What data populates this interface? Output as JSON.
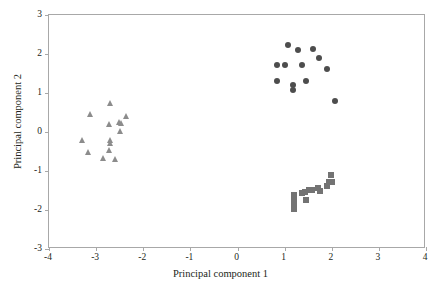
{
  "chart_data": {
    "type": "scatter",
    "title": "",
    "xlabel": "Principal component 1",
    "ylabel": "Principal component 2",
    "xlim": [
      -4,
      4
    ],
    "ylim": [
      -3,
      3
    ],
    "xticks": [
      "-4",
      "-3",
      "-2",
      "-1",
      "0",
      "1",
      "2",
      "3",
      "4"
    ],
    "xtick_values": [
      -4,
      -3,
      -2,
      -1,
      0,
      1,
      2,
      3,
      4
    ],
    "yticks": [
      "3",
      "2",
      "1",
      "0",
      "-1",
      "-2",
      "-3"
    ],
    "ytick_values": [
      3,
      2,
      1,
      0,
      -1,
      -2,
      -3
    ],
    "grid": false,
    "legend": "none",
    "series": [
      {
        "name": "group-circles",
        "marker": "circle",
        "color": "#4d4d4d",
        "points": [
          [
            1.1,
            2.2
          ],
          [
            1.3,
            2.07
          ],
          [
            1.62,
            2.09
          ],
          [
            0.86,
            1.69
          ],
          [
            1.03,
            1.69
          ],
          [
            1.4,
            1.7
          ],
          [
            1.75,
            1.88
          ],
          [
            1.92,
            1.58
          ],
          [
            0.85,
            1.27
          ],
          [
            1.2,
            1.17
          ],
          [
            1.2,
            1.04
          ],
          [
            1.48,
            1.29
          ],
          [
            2.1,
            0.76
          ]
        ]
      },
      {
        "name": "group-triangles",
        "marker": "triangle",
        "color": "#8c8c8c",
        "points": [
          [
            -2.68,
            0.73
          ],
          [
            -3.1,
            0.44
          ],
          [
            -2.7,
            0.18
          ],
          [
            -2.49,
            0.22
          ],
          [
            -2.44,
            0.21
          ],
          [
            -2.33,
            0.39
          ],
          [
            -2.47,
            0.01
          ],
          [
            -3.27,
            -0.24
          ],
          [
            -2.68,
            -0.23
          ],
          [
            -2.68,
            -0.3
          ],
          [
            -3.13,
            -0.55
          ],
          [
            -2.7,
            -0.48
          ],
          [
            -2.83,
            -0.68
          ],
          [
            -2.56,
            -0.72
          ]
        ]
      },
      {
        "name": "group-squares",
        "marker": "square",
        "color": "#737373",
        "points": [
          [
            2.0,
            -1.13
          ],
          [
            1.73,
            -1.47
          ],
          [
            1.77,
            -1.53
          ],
          [
            1.92,
            -1.4
          ],
          [
            1.97,
            -1.32
          ],
          [
            2.02,
            -1.3
          ],
          [
            1.6,
            -1.5
          ],
          [
            1.53,
            -1.52
          ],
          [
            1.45,
            -1.56
          ],
          [
            1.38,
            -1.6
          ],
          [
            1.21,
            -1.65
          ],
          [
            1.21,
            -1.74
          ],
          [
            1.48,
            -1.76
          ],
          [
            1.22,
            -1.9
          ],
          [
            1.22,
            -2.0
          ]
        ]
      }
    ]
  },
  "axes": {
    "frame_color": "#a8a8a8",
    "text_color": "#231f20"
  }
}
